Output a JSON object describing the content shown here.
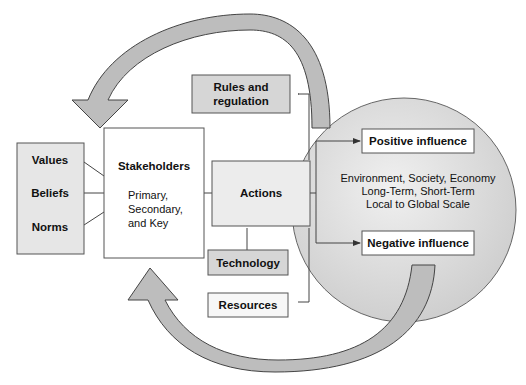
{
  "diagram": {
    "left_box": {
      "items": [
        "Values",
        "Beliefs",
        "Norms"
      ],
      "fill": "#e6e6e6"
    },
    "stakeholders": {
      "title": "Stakeholders",
      "lines": [
        "Primary,",
        "Secondary,",
        "and Key"
      ]
    },
    "rules": {
      "lines": [
        "Rules and",
        "regulation"
      ],
      "fill": "#d6d6d6"
    },
    "actions": {
      "label": "Actions",
      "fill": "#ececec"
    },
    "technology": {
      "label": "Technology",
      "fill": "#d6d6d6"
    },
    "resources": {
      "label": "Resources",
      "fill": "#f7f7f7"
    },
    "circle": {
      "fill": "#d9d9d9",
      "lines": [
        "Environment, Society, Economy",
        "Long-Term, Short-Term",
        "Local to Global Scale"
      ]
    },
    "positive": {
      "label": "Positive influence"
    },
    "negative": {
      "label": "Negative influence"
    },
    "arrow_fill": "#bdbdbd"
  }
}
